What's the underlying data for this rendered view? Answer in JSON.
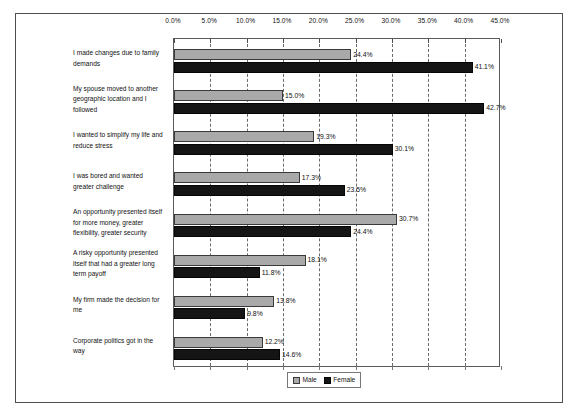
{
  "chart_data": {
    "type": "bar",
    "orientation": "horizontal",
    "title": "",
    "xlabel": "",
    "ylabel": "",
    "xlim": [
      0,
      45
    ],
    "xtick_values": [
      0,
      5,
      10,
      15,
      20,
      25,
      30,
      35,
      40,
      45
    ],
    "xtick_labels": [
      "0.0%",
      "5.0%",
      "10.0%",
      "15.0%",
      "20.0%",
      "25.0%",
      "30.0%",
      "35.0%",
      "40.0%",
      "45.0%"
    ],
    "grid": true,
    "grid_style": "dashed-vertical",
    "axis_position": "top",
    "legend_position": "bottom-center",
    "categories": [
      {
        "label": "I made changes due to family demands",
        "lines": [
          "I made changes due to family",
          "demands"
        ]
      },
      {
        "label": "My spouse moved to another geographic location and I followed",
        "lines": [
          "My spouse moved to another",
          "geographic location and I",
          "followed"
        ]
      },
      {
        "label": "I wanted to simplify my life and reduce stress",
        "lines": [
          "I wanted to simplify my life and",
          "reduce stress"
        ]
      },
      {
        "label": "I was bored and wanted greater challenge",
        "lines": [
          "I was bored and wanted",
          "greater challenge"
        ]
      },
      {
        "label": "An opportunity presented itself for more money, greater flexibility, greater security",
        "lines": [
          "An opportunity presented itself",
          "for more money, greater",
          "flexibility, greater security"
        ]
      },
      {
        "label": "A risky opportunity presented itself that had a greater long term payoff",
        "lines": [
          "A risky opportunity presented",
          "itself that had a greater long",
          "term payoff"
        ]
      },
      {
        "label": "My firm made the decision for me",
        "lines": [
          "My firm made the decision for",
          "me"
        ]
      },
      {
        "label": "Corporate politics got in the way",
        "lines": [
          "Corporate politics got in the",
          "way"
        ]
      }
    ],
    "series": [
      {
        "name": "Male",
        "color": "#a9a9a9",
        "values": [
          24.4,
          15.0,
          19.3,
          17.3,
          30.7,
          18.1,
          13.8,
          12.2
        ],
        "labels": [
          "24.4%",
          "15.0%",
          "19.3%",
          "17.3%",
          "30.7%",
          "18.1%",
          "13.8%",
          "12.2%"
        ]
      },
      {
        "name": "Female",
        "color": "#151515",
        "values": [
          41.1,
          42.7,
          30.1,
          23.5,
          24.4,
          11.8,
          9.8,
          14.6
        ],
        "labels": [
          "41.1%",
          "42.7%",
          "30.1%",
          "23.5%",
          "24.4%",
          "11.8%",
          "9.8%",
          "14.6%"
        ]
      }
    ]
  },
  "legend": {
    "entries": [
      {
        "name": "Male"
      },
      {
        "name": "Female"
      }
    ]
  }
}
